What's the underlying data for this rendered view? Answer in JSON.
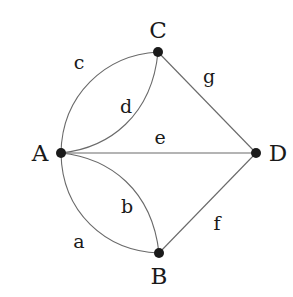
{
  "diagram": {
    "type": "multigraph",
    "vertices": [
      {
        "id": "A",
        "label": "A",
        "x": 61,
        "y": 153
      },
      {
        "id": "B",
        "label": "B",
        "x": 159,
        "y": 253
      },
      {
        "id": "C",
        "label": "C",
        "x": 158,
        "y": 52
      },
      {
        "id": "D",
        "label": "D",
        "x": 256,
        "y": 153
      }
    ],
    "edges": [
      {
        "id": "a",
        "label": "a",
        "from": "A",
        "to": "B",
        "shape": "curve-outer"
      },
      {
        "id": "b",
        "label": "b",
        "from": "A",
        "to": "B",
        "shape": "curve-inner"
      },
      {
        "id": "c",
        "label": "c",
        "from": "A",
        "to": "C",
        "shape": "curve-outer"
      },
      {
        "id": "d",
        "label": "d",
        "from": "A",
        "to": "C",
        "shape": "curve-inner"
      },
      {
        "id": "e",
        "label": "e",
        "from": "A",
        "to": "D",
        "shape": "straight"
      },
      {
        "id": "f",
        "label": "f",
        "from": "B",
        "to": "D",
        "shape": "straight"
      },
      {
        "id": "g",
        "label": "g",
        "from": "C",
        "to": "D",
        "shape": "straight"
      }
    ]
  }
}
